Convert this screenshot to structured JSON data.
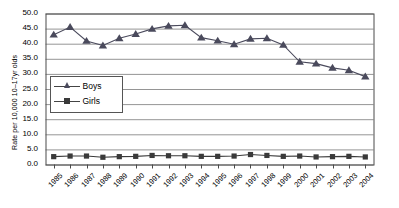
{
  "chart_data": {
    "type": "line",
    "title": "",
    "xlabel": "",
    "ylabel": "Rate per 10,000 10–17yr olds",
    "ylim": [
      0.0,
      50.0
    ],
    "ytick_labels": [
      "0.0",
      "5.0",
      "10.0",
      "15.0",
      "20.0",
      "25.0",
      "30.0",
      "35.0",
      "40.0",
      "45.0",
      "50.0"
    ],
    "ytick_values": [
      0,
      5,
      10,
      15,
      20,
      25,
      30,
      35,
      40,
      45,
      50
    ],
    "grid": true,
    "legend_position": "inside-left",
    "categories": [
      "1985",
      "1986",
      "1987",
      "1988",
      "1989",
      "1990",
      "1991",
      "1992",
      "1993",
      "1994",
      "1995",
      "1996",
      "1997",
      "1998",
      "1999",
      "2000",
      "2001",
      "2002",
      "2003",
      "2004"
    ],
    "series": [
      {
        "name": "Boys",
        "marker": "triangle",
        "color": "#4a4a5c",
        "values": [
          43.0,
          45.5,
          40.9,
          39.4,
          41.8,
          43.2,
          44.9,
          45.9,
          46.1,
          42.0,
          41.0,
          39.8,
          41.6,
          41.8,
          39.6,
          34.0,
          33.4,
          32.0,
          31.2,
          29.1
        ]
      },
      {
        "name": "Girls",
        "marker": "square",
        "color": "#3a3a3a",
        "values": [
          2.6,
          2.8,
          2.8,
          2.4,
          2.6,
          2.7,
          3.0,
          2.9,
          2.9,
          2.7,
          2.7,
          2.8,
          3.3,
          3.0,
          2.7,
          2.8,
          2.5,
          2.6,
          2.7,
          2.5
        ]
      }
    ]
  },
  "legend": {
    "items": [
      {
        "label": "Boys"
      },
      {
        "label": "Girls"
      }
    ]
  }
}
